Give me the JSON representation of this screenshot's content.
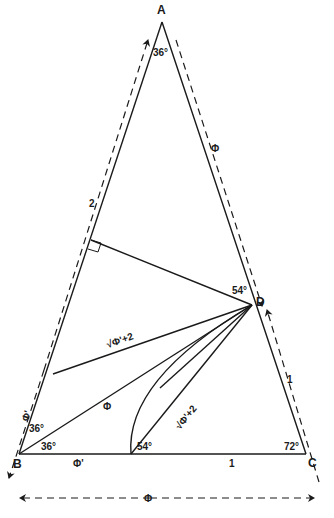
{
  "vertices": {
    "A": "A",
    "B": "B",
    "C": "C",
    "D": "D"
  },
  "angles": {
    "A": "36°",
    "B_upper": "36°",
    "B_lower": "36°",
    "C": "72°",
    "D": "54°",
    "base_point": "54°"
  },
  "side_labels": {
    "AB_segment_upper": "2",
    "AB_segment_lower": "Φ'",
    "AC_dimension": "Φ",
    "DC_dimension": "1",
    "BC_left": "Φ'",
    "BC_right": "1",
    "BC_dimension": "Φ",
    "BD_diagonal": "Φ",
    "upper_chord": "√Φ'+2",
    "lower_chord": "√Φ'+2"
  },
  "markers": {
    "right_angle": "right-angle-marker",
    "dimension_arrows": "dashed-arrow"
  },
  "colors": {
    "line": "#1a1a1a",
    "background": "#ffffff"
  }
}
